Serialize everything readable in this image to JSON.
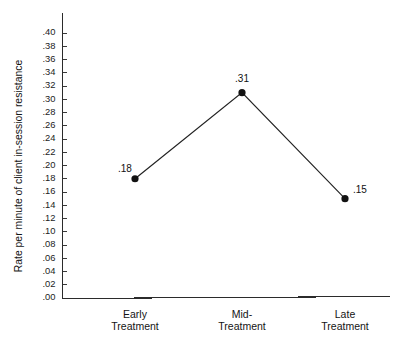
{
  "chart_data": {
    "type": "line",
    "title": "",
    "xlabel": "",
    "ylabel": "Rate per minute of client in-session resistance",
    "categories": [
      "Early Treatment",
      "Mid-Treatment",
      "Late Treatment"
    ],
    "category_lines": [
      [
        "Early",
        "Treatment"
      ],
      [
        "Mid-",
        "Treatment"
      ],
      [
        "Late",
        "Treatment"
      ]
    ],
    "values": [
      0.18,
      0.31,
      0.15
    ],
    "point_labels": [
      ".18",
      ".31",
      ".15"
    ],
    "ylim": [
      0.0,
      0.4
    ],
    "ytick_step": 0.02,
    "ytick_labels": [
      ".00",
      ".02",
      ".04",
      ".06",
      ".08",
      ".10",
      ".12",
      ".14",
      ".16",
      ".18",
      ".20",
      ".22",
      ".24",
      ".26",
      ".28",
      ".30",
      ".32",
      ".34",
      ".36",
      ".38",
      ".40"
    ],
    "ytick_values": [
      0.0,
      0.02,
      0.04,
      0.06,
      0.08,
      0.1,
      0.12,
      0.14,
      0.16,
      0.18,
      0.2,
      0.22,
      0.24,
      0.26,
      0.28,
      0.3,
      0.32,
      0.34,
      0.36,
      0.38,
      0.4
    ],
    "grid": false,
    "legend": false,
    "legend_position": "none",
    "marker": "filled-circle",
    "line_color": "#232323",
    "marker_color": "#121212",
    "axis_color": "#2b2b2b",
    "background_color": "#ffffff"
  }
}
